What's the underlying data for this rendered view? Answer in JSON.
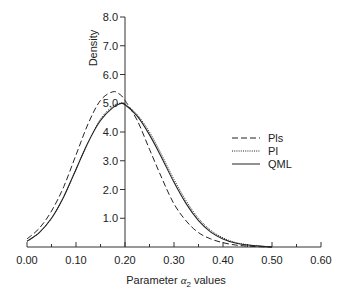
{
  "chart_data": {
    "type": "line",
    "title": "",
    "xlabel": "Parameter α2 values",
    "xlabel_prefix": "Parameter ",
    "xlabel_symbol": "α",
    "xlabel_subscript": "2",
    "xlabel_suffix": " values",
    "ylabel": "Density",
    "xlim": [
      0.0,
      0.6
    ],
    "ylim": [
      0.0,
      8.0
    ],
    "grid": false,
    "legend_position": "right-middle",
    "x_ticks": [
      "0.00",
      "0.10",
      "0.20",
      "0.30",
      "0.40",
      "0.50",
      "0.60"
    ],
    "y_ticks": [
      "1.0",
      "2.0",
      "3.0",
      "4.0",
      "5.0",
      "6.0",
      "7.0",
      "8.0"
    ],
    "x": [
      0.0,
      0.025,
      0.05,
      0.075,
      0.1,
      0.125,
      0.15,
      0.175,
      0.19,
      0.2,
      0.225,
      0.25,
      0.275,
      0.3,
      0.325,
      0.35,
      0.375,
      0.4,
      0.425,
      0.45,
      0.475,
      0.5
    ],
    "series": [
      {
        "name": "Pls",
        "style": "dashed",
        "values": [
          0.28,
          0.65,
          1.25,
          2.1,
          3.2,
          4.3,
          5.1,
          5.4,
          5.3,
          5.1,
          4.4,
          3.4,
          2.4,
          1.5,
          0.9,
          0.5,
          0.28,
          0.15,
          0.07,
          0.03,
          0.01,
          0.0
        ]
      },
      {
        "name": "PI",
        "style": "dotted",
        "values": [
          0.2,
          0.5,
          1.0,
          1.75,
          2.7,
          3.65,
          4.45,
          4.9,
          5.0,
          4.97,
          4.6,
          4.0,
          3.2,
          2.35,
          1.6,
          1.0,
          0.58,
          0.32,
          0.16,
          0.08,
          0.03,
          0.0
        ]
      },
      {
        "name": "QML",
        "style": "solid",
        "values": [
          0.2,
          0.5,
          1.0,
          1.75,
          2.7,
          3.65,
          4.4,
          4.85,
          4.98,
          4.95,
          4.55,
          3.9,
          3.1,
          2.25,
          1.5,
          0.92,
          0.52,
          0.28,
          0.14,
          0.07,
          0.03,
          0.0
        ]
      }
    ]
  },
  "legend": {
    "items": [
      {
        "label": "Pls",
        "style": "dashed"
      },
      {
        "label": "PI",
        "style": "dotted"
      },
      {
        "label": "QML",
        "style": "solid"
      }
    ]
  },
  "colors": {
    "line": "#222222",
    "axis": "#333333",
    "background": "#ffffff"
  }
}
